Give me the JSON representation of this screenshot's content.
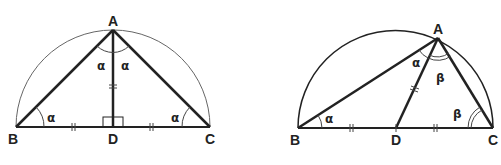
{
  "figures": [
    {
      "name": "isosceles-right-triangle",
      "points": {
        "A": "A",
        "B": "B",
        "C": "C",
        "D": "D"
      },
      "angles": {
        "BAD": "α",
        "DAC": "α",
        "ABD": "α",
        "ACD": "α"
      },
      "marks": "BD = DC = AD; AD ⟂ BC"
    },
    {
      "name": "general-right-triangle",
      "points": {
        "A": "A",
        "B": "B",
        "C": "C",
        "D": "D"
      },
      "angles": {
        "BAD": "α",
        "DAC": "β",
        "ABD": "α",
        "ACD": "β"
      },
      "marks": "BD = DC = AD"
    }
  ],
  "colors": {
    "stroke": "#222222",
    "circle": "#555555",
    "background": "#ffffff"
  }
}
